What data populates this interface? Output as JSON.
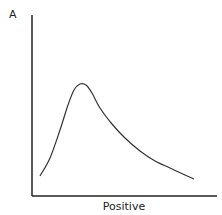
{
  "chart_data": {
    "type": "line",
    "title": "",
    "xlabel": "Positive",
    "ylabel": "A",
    "grid": false,
    "legend": null,
    "series": [
      {
        "name": "curve",
        "points_px": [
          [
            40,
            176
          ],
          [
            50,
            158
          ],
          [
            60,
            130
          ],
          [
            68,
            105
          ],
          [
            74,
            90
          ],
          [
            80,
            84
          ],
          [
            86,
            85
          ],
          [
            92,
            93
          ],
          [
            100,
            108
          ],
          [
            112,
            124
          ],
          [
            125,
            138
          ],
          [
            140,
            151
          ],
          [
            155,
            161
          ],
          [
            170,
            168
          ],
          [
            185,
            175
          ],
          [
            194,
            179
          ]
        ]
      }
    ],
    "colors": {
      "line": "#333333",
      "axis": "#222222"
    }
  }
}
